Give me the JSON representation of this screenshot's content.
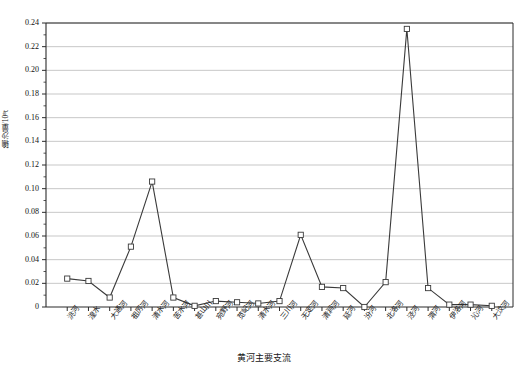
{
  "chart_data": {
    "type": "line",
    "title": "",
    "xlabel": "黄河主要支流",
    "ylabel": "输沙量/10⁸t",
    "ylim": [
      0,
      0.24
    ],
    "ytick_step": 0.02,
    "grid": true,
    "legend": "none",
    "marker": "open-square",
    "line_color": "#3a3a3a",
    "grid_color": "#b9b9b9",
    "axis_color": "#2b2b2b",
    "yticks": [
      "0",
      "0.02",
      "0.04",
      "0.06",
      "0.08",
      "0.10",
      "0.12",
      "0.14",
      "0.16",
      "0.18",
      "0.20",
      "0.22",
      "0.24"
    ],
    "categories": [
      "洮河",
      "湟水",
      "大通河",
      "祖厉河",
      "清水河",
      "苦水河",
      "甚山川",
      "宛野河",
      "苋屺河",
      "清水河",
      "三川河",
      "无定河",
      "清涧河",
      "延河",
      "汾河",
      "北洛河",
      "泾河",
      "渭河",
      "伊洛河",
      "沁河",
      "大汶河"
    ],
    "values": [
      0.024,
      0.022,
      0.008,
      0.051,
      0.106,
      0.008,
      0.001,
      0.005,
      0.004,
      0.003,
      0.005,
      0.061,
      0.017,
      0.016,
      0.0,
      0.021,
      0.235,
      0.016,
      0.002,
      0.002,
      0.001
    ]
  }
}
